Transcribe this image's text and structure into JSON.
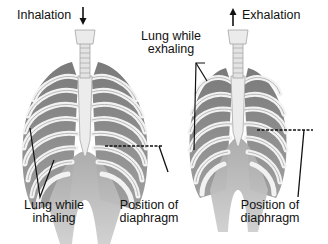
{
  "diagram": {
    "left_panel": {
      "name": "Inhalation",
      "arrow": "down",
      "labels": {
        "action": "Inhalation",
        "lung_line1": "Lung while",
        "lung_line2": "inhaling",
        "diaphragm_line1": "Position of",
        "diaphragm_line2": "diaphragm"
      }
    },
    "right_panel": {
      "name": "Exhalation",
      "arrow": "up",
      "labels": {
        "action": "Exhalation",
        "lung_line1": "Lung while",
        "lung_line2": "exhaling",
        "diaphragm_line1": "Position of",
        "diaphragm_line2": "diaphragm"
      }
    },
    "colors": {
      "background": "#ffffff",
      "bone": "#e6e6e6",
      "bone_outline": "#a8a8a8",
      "lung": "#8c8c8c",
      "muscle": "#b5b5b5",
      "leader_line": "#111111",
      "text": "#111111"
    }
  }
}
